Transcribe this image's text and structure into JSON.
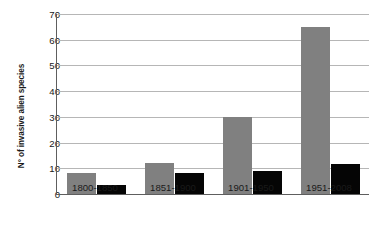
{
  "chart_data": {
    "type": "bar",
    "title": "",
    "xlabel": "",
    "ylabel": "N° of invasive alien species",
    "categories": [
      "1800-1850",
      "1851-1900",
      "1901-1950",
      "1951-2008"
    ],
    "series": [
      {
        "name": "series-1",
        "color": "#808080",
        "values": [
          8,
          12,
          30,
          65
        ]
      },
      {
        "name": "series-2",
        "color": "#050505",
        "values": [
          3.5,
          8,
          9,
          11.5
        ]
      }
    ],
    "ylim": [
      0,
      70
    ],
    "yticks": [
      0,
      10,
      20,
      30,
      40,
      50,
      60,
      70
    ],
    "ytick_labels": [
      "0",
      "10",
      "20",
      "30",
      "40",
      "50",
      "60",
      "70"
    ],
    "grid": "horizontal",
    "legend": "none",
    "axis_color": "#5e5e5e",
    "gridline_color": "#b6b6b6",
    "background": "#ffffff"
  }
}
